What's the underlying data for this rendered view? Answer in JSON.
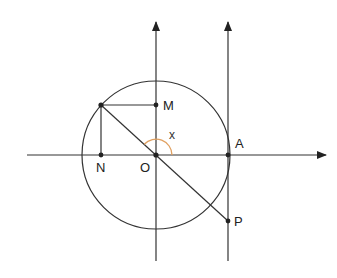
{
  "diagram": {
    "type": "trigonometric-circle",
    "colors": {
      "stroke": "#333333",
      "arc": "#e0a060",
      "background": "#ffffff"
    },
    "labels": {
      "origin": "O",
      "point_a": "A",
      "point_m": "M",
      "point_n": "N",
      "point_p": "P",
      "angle": "x"
    },
    "points": {
      "O": [
        156,
        155
      ],
      "A": [
        228,
        155
      ],
      "M": [
        156,
        105
      ],
      "N": [
        101,
        155
      ],
      "P": [
        228,
        221
      ],
      "circle_point": [
        101,
        105
      ]
    },
    "circle_radius": 74
  }
}
